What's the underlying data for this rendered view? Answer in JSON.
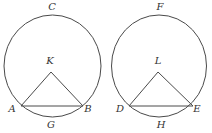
{
  "diagram": {
    "type": "geometry",
    "colors": {
      "stroke": "#4a4a4a",
      "label": "#333333",
      "background": "#ffffff"
    },
    "figures": [
      {
        "id": "left",
        "circle": {
          "cx": 52.5,
          "cy": 66,
          "rx": 48.5,
          "ry": 51
        },
        "center_point": {
          "name": "K",
          "x": 51,
          "y": 72
        },
        "chord_points": [
          {
            "name": "A",
            "x": 21,
            "y": 106
          },
          {
            "name": "B",
            "x": 83,
            "y": 106
          }
        ],
        "labels": [
          {
            "text": "C",
            "x": 52,
            "y": 10
          },
          {
            "text": "K",
            "x": 50,
            "y": 64
          },
          {
            "text": "A",
            "x": 12,
            "y": 112
          },
          {
            "text": "B",
            "x": 88,
            "y": 112
          },
          {
            "text": "G",
            "x": 51,
            "y": 128
          }
        ]
      },
      {
        "id": "right",
        "circle": {
          "cx": 159,
          "cy": 66,
          "rx": 47.5,
          "ry": 51
        },
        "center_point": {
          "name": "L",
          "x": 158,
          "y": 72
        },
        "chord_points": [
          {
            "name": "D",
            "x": 129,
            "y": 106
          },
          {
            "name": "E",
            "x": 193,
            "y": 106
          }
        ],
        "labels": [
          {
            "text": "F",
            "x": 160,
            "y": 10
          },
          {
            "text": "L",
            "x": 158,
            "y": 64
          },
          {
            "text": "D",
            "x": 120,
            "y": 112
          },
          {
            "text": "E",
            "x": 197,
            "y": 112
          },
          {
            "text": "H",
            "x": 161,
            "y": 128
          }
        ]
      }
    ]
  }
}
